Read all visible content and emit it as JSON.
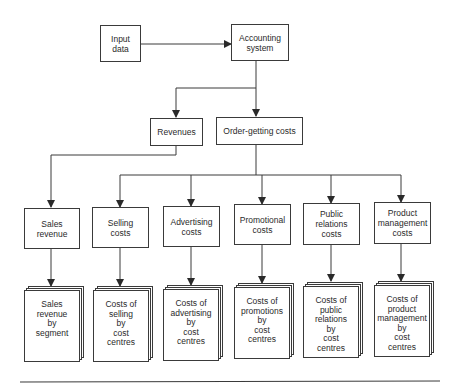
{
  "diagram": {
    "top": {
      "input": "Input\ndata",
      "system": "Accounting\nsystem"
    },
    "level2": {
      "revenues": "Revenues",
      "order_getting": "Order-getting costs"
    },
    "categories": [
      {
        "label": "Sales\nrevenue",
        "report": "Sales\nrevenue\nby\nsegment"
      },
      {
        "label": "Selling\ncosts",
        "report": "Costs of\nselling\nby\ncost\ncentres"
      },
      {
        "label": "Advertising\ncosts",
        "report": "Costs of\nadvertising\nby\ncost\ncentres"
      },
      {
        "label": "Promotional\ncosts",
        "report": "Costs of\npromotions\nby\ncost\ncentres"
      },
      {
        "label": "Public\nrelations\ncosts",
        "report": "Costs of\npublic\nrelations\nby\ncost\ncentres"
      },
      {
        "label": "Product\nmanagement\ncosts",
        "report": "Costs of\nproduct\nmanagement\nby\ncost\ncentres"
      }
    ]
  }
}
